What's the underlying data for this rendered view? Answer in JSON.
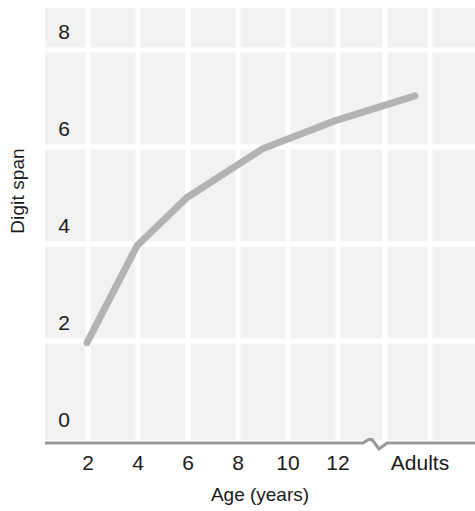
{
  "chart_data": {
    "type": "line",
    "title": "",
    "xlabel": "Age (years)",
    "ylabel": "Digit span",
    "x_tick_labels": [
      "2",
      "4",
      "6",
      "8",
      "10",
      "12",
      "Adults"
    ],
    "x_tick_values": [
      2,
      4,
      6,
      8,
      10,
      12,
      18
    ],
    "y_tick_labels": [
      "0",
      "2",
      "4",
      "6",
      "8"
    ],
    "y_tick_values": [
      0,
      2,
      4,
      6,
      8
    ],
    "ylim": [
      0,
      8.5
    ],
    "xlim": [
      1,
      19
    ],
    "grid": true,
    "axis_break": true,
    "axis_break_label": "Adults",
    "legend": "none",
    "series": [
      {
        "name": "Digit span",
        "color": "#b3b3b3",
        "x": [
          2,
          4,
          6,
          9,
          12,
          18
        ],
        "x_labels": [
          "2",
          "4",
          "6",
          "9",
          "12",
          "Adults"
        ],
        "values": [
          1.6,
          3.6,
          4.6,
          5.6,
          6.2,
          6.7
        ]
      }
    ]
  },
  "chart": {
    "y_axis_title": "Digit span",
    "x_axis_title": "Age (years)",
    "y_ticks": [
      {
        "label": "8",
        "value": 8
      },
      {
        "label": "6",
        "value": 6
      },
      {
        "label": "4",
        "value": 4
      },
      {
        "label": "2",
        "value": 2
      },
      {
        "label": "0",
        "value": 0
      }
    ],
    "x_ticks": [
      {
        "label": "2",
        "value": 2
      },
      {
        "label": "4",
        "value": 4
      },
      {
        "label": "6",
        "value": 6
      },
      {
        "label": "8",
        "value": 8
      },
      {
        "label": "10",
        "value": 10
      },
      {
        "label": "12",
        "value": 12
      },
      {
        "label": "Adults",
        "value": 18
      }
    ],
    "colors": {
      "plot_background": "#f2f2f2",
      "gridline": "#ffffff",
      "line": "#b3b3b3",
      "axis": "#9a9a9a",
      "text": "#1b1b1b"
    }
  }
}
